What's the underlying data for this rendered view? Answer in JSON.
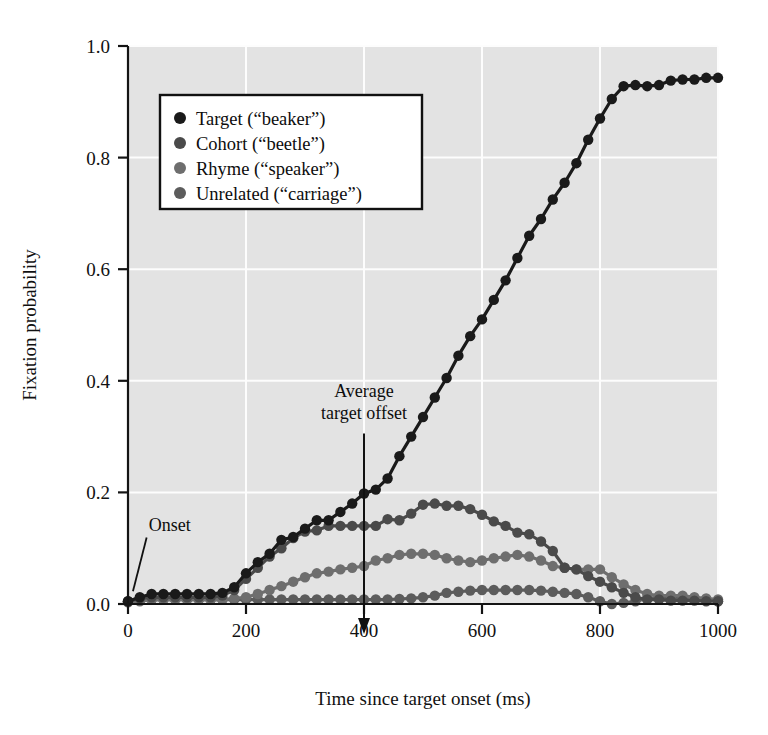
{
  "figure": {
    "background_color": "#ffffff",
    "plot_background_color": "#e3e3e3",
    "grid_color": "#fdfdfd",
    "axis_color": "#141414"
  },
  "chart_data": {
    "type": "line",
    "title": "",
    "xlabel": "Time since target onset (ms)",
    "ylabel": "Fixation probability",
    "xlim": [
      0,
      1000
    ],
    "ylim": [
      0.0,
      1.0
    ],
    "xticks": [
      0,
      200,
      400,
      600,
      800,
      1000
    ],
    "xtick_labels": [
      "0",
      "200",
      "400",
      "600",
      "800",
      "1000"
    ],
    "yticks": [
      0.0,
      0.2,
      0.4,
      0.6,
      0.8,
      1.0
    ],
    "ytick_labels": [
      "0.0",
      "0.2",
      "0.4",
      "0.6",
      "0.8",
      "1.0"
    ],
    "grid": true,
    "grid_axis": "both",
    "legend_position": "upper left",
    "marker": "circle",
    "x": [
      0,
      20,
      40,
      60,
      80,
      100,
      120,
      140,
      160,
      180,
      200,
      220,
      240,
      260,
      280,
      300,
      320,
      340,
      360,
      380,
      400,
      420,
      440,
      460,
      480,
      500,
      520,
      540,
      560,
      580,
      600,
      620,
      640,
      660,
      680,
      700,
      720,
      740,
      760,
      780,
      800,
      820,
      840,
      860,
      880,
      900,
      920,
      940,
      960,
      980,
      1000
    ],
    "series": [
      {
        "name": "Target (“beaker”)",
        "color": "#1a1a1a",
        "values": [
          0.005,
          0.012,
          0.018,
          0.018,
          0.018,
          0.018,
          0.018,
          0.018,
          0.02,
          0.03,
          0.055,
          0.075,
          0.09,
          0.115,
          0.12,
          0.135,
          0.15,
          0.15,
          0.165,
          0.18,
          0.198,
          0.205,
          0.225,
          0.265,
          0.3,
          0.335,
          0.37,
          0.405,
          0.445,
          0.48,
          0.51,
          0.545,
          0.58,
          0.62,
          0.66,
          0.69,
          0.725,
          0.755,
          0.79,
          0.832,
          0.87,
          0.905,
          0.928,
          0.93,
          0.928,
          0.93,
          0.938,
          0.94,
          0.94,
          0.943,
          0.943
        ]
      },
      {
        "name": "Cohort (“beetle”)",
        "color": "#4a4a4a",
        "values": [
          0.005,
          0.01,
          0.012,
          0.012,
          0.012,
          0.012,
          0.012,
          0.012,
          0.015,
          0.025,
          0.045,
          0.065,
          0.085,
          0.1,
          0.118,
          0.13,
          0.132,
          0.14,
          0.14,
          0.14,
          0.14,
          0.14,
          0.152,
          0.15,
          0.162,
          0.178,
          0.18,
          0.176,
          0.176,
          0.17,
          0.16,
          0.148,
          0.14,
          0.128,
          0.125,
          0.112,
          0.095,
          0.065,
          0.062,
          0.05,
          0.04,
          0.03,
          0.02,
          0.012,
          0.008,
          0.008,
          0.006,
          0.006,
          0.006,
          0.005,
          0.005
        ]
      },
      {
        "name": "Rhyme (“speaker”)",
        "color": "#6e6e6e",
        "values": [
          0.003,
          0.005,
          0.008,
          0.008,
          0.008,
          0.008,
          0.008,
          0.008,
          0.008,
          0.01,
          0.012,
          0.018,
          0.025,
          0.032,
          0.04,
          0.048,
          0.055,
          0.058,
          0.062,
          0.065,
          0.068,
          0.078,
          0.082,
          0.088,
          0.09,
          0.09,
          0.088,
          0.082,
          0.078,
          0.075,
          0.078,
          0.082,
          0.085,
          0.088,
          0.085,
          0.078,
          0.068,
          0.065,
          0.062,
          0.062,
          0.062,
          0.048,
          0.035,
          0.025,
          0.018,
          0.015,
          0.015,
          0.015,
          0.012,
          0.01,
          0.008
        ]
      },
      {
        "name": "Unrelated (“carriage”)",
        "color": "#5c5c5c",
        "values": [
          0.004,
          0.006,
          0.008,
          0.008,
          0.008,
          0.008,
          0.008,
          0.008,
          0.008,
          0.008,
          0.008,
          0.008,
          0.008,
          0.008,
          0.008,
          0.008,
          0.008,
          0.008,
          0.008,
          0.008,
          0.008,
          0.008,
          0.008,
          0.009,
          0.01,
          0.012,
          0.015,
          0.02,
          0.022,
          0.024,
          0.025,
          0.025,
          0.025,
          0.025,
          0.025,
          0.024,
          0.022,
          0.02,
          0.018,
          0.012,
          0.005,
          0.0,
          0.002,
          0.005,
          0.01,
          0.012,
          0.012,
          0.012,
          0.01,
          0.008,
          0.005
        ]
      }
    ],
    "annotations": [
      {
        "id": "onset",
        "text": "Onset",
        "x": 35,
        "y": 0.13,
        "pointer_x": 5,
        "pointer_y": 0.012
      },
      {
        "id": "average-target-offset",
        "text_line1": "Average",
        "text_line2": "target offset",
        "x": 400,
        "y_top": 0.32,
        "arrow_to_y": 0.0
      }
    ]
  }
}
